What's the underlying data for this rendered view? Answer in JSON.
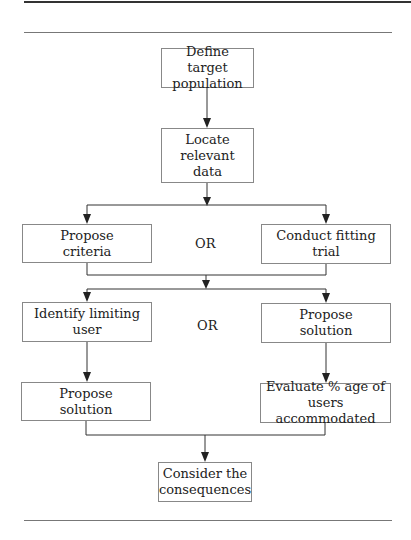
{
  "diagram": {
    "type": "flowchart",
    "nodes": {
      "define": "Define target\npopulation",
      "locate": "Locate\nrelevant\ndata",
      "criteria": "Propose\ncriteria",
      "fitting": "Conduct fitting\ntrial",
      "limiting": "Identify limiting\nuser",
      "propose_right": "Propose\nsolution",
      "propose_left": "Propose\nsolution",
      "evaluate": "Evaluate % age of\nusers accommodated",
      "consider": "Consider the\nconsequences"
    },
    "connectors": {
      "or_1": "OR",
      "or_2": "OR"
    },
    "edges": [
      [
        "define",
        "locate"
      ],
      [
        "locate",
        "criteria"
      ],
      [
        "locate",
        "fitting"
      ],
      [
        "criteria",
        "limiting"
      ],
      [
        "criteria",
        "propose_right"
      ],
      [
        "fitting",
        "limiting"
      ],
      [
        "fitting",
        "propose_right"
      ],
      [
        "limiting",
        "propose_left"
      ],
      [
        "propose_right",
        "evaluate"
      ],
      [
        "propose_left",
        "consider"
      ],
      [
        "evaluate",
        "consider"
      ]
    ]
  }
}
